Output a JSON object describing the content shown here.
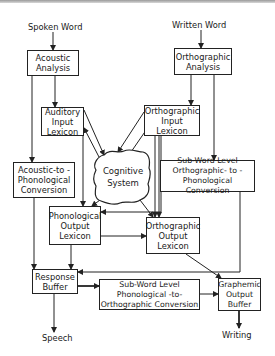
{
  "diagram": {
    "inputs": {
      "spoken_word": "Spoken Word",
      "written_word": "Written Word"
    },
    "outputs": {
      "speech": "Speech",
      "writing": "Writing"
    },
    "nodes": {
      "acoustic_analysis": "Acoustic\nAnalysis",
      "auditory_input_lexicon": "Auditory\nInput\nLexicon",
      "acoustic_to_phonological": "Acoustic-to -\nPhonological\nConversion",
      "orthographic_analysis": "Orthographic\nAnalysis",
      "orthographic_input_lexicon": "Orthographic\nInput\nLexicon",
      "subword_orth_to_phon": "Sub-Word Level\nOrthographic- to -\nPhonological Conversion",
      "cognitive_system": "Cognitive\nSystem",
      "phonological_output_lexicon": "Phonological\nOutput\nLexicon",
      "orthographic_output_lexicon": "Orthographic\nOutput\nLexicon",
      "response_buffer": "Response\nBuffer",
      "subword_phon_to_orth": "Sub-Word Level\nPhonological -to-\nOrthographic Conversion",
      "graphemic_output_buffer": "Graphemic\nOutput\nBuffer"
    },
    "colors": {
      "line": "#222222",
      "background": "#ffffff"
    }
  }
}
